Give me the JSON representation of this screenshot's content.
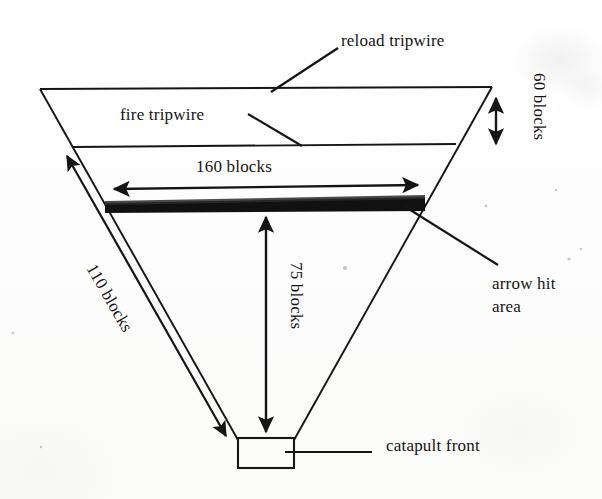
{
  "document": {
    "type": "hand-drawn-diagram",
    "title": "catapult trap layout",
    "background_color": "#fdfdfd",
    "ink_color": "#151515"
  },
  "diagram": {
    "shape": "inverted-trapezoid",
    "labels": {
      "reload_tripwire": "reload tripwire",
      "fire_tripwire": "fire tripwire",
      "width_top": "160 blocks",
      "height_side": "60 blocks",
      "depth_center": "75 blocks",
      "diagonal_left": "110 blocks",
      "arrow_hit_area_line1": "arrow hit",
      "arrow_hit_area_line2": "area",
      "catapult_front": "catapult front"
    },
    "measurements": [
      {
        "name": "160 blocks",
        "value": 160,
        "unit": "blocks",
        "axis": "horizontal",
        "describes": "width of arrow hit area"
      },
      {
        "name": "60 blocks",
        "value": 60,
        "unit": "blocks",
        "axis": "vertical",
        "describes": "right side height between reload and fire tripwire"
      },
      {
        "name": "75 blocks",
        "value": 75,
        "unit": "blocks",
        "axis": "vertical",
        "describes": "depth from arrow hit area down to catapult front"
      },
      {
        "name": "110 blocks",
        "value": 110,
        "unit": "blocks",
        "axis": "diagonal",
        "describes": "left slanted edge length"
      }
    ],
    "features": [
      {
        "name": "reload tripwire",
        "kind": "line",
        "position": "top edge"
      },
      {
        "name": "fire tripwire",
        "kind": "line",
        "position": "second horizontal line"
      },
      {
        "name": "arrow hit area",
        "kind": "thick-black-bar",
        "position": "third horizontal band"
      },
      {
        "name": "catapult front",
        "kind": "rectangle",
        "position": "bottom apex"
      }
    ]
  }
}
